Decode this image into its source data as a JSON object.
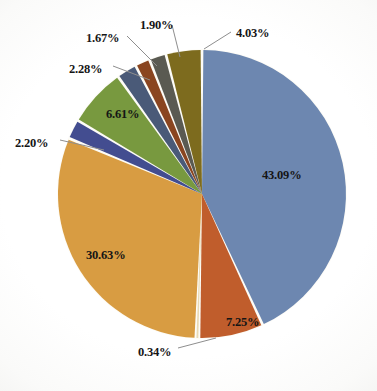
{
  "chart_data": {
    "type": "pie",
    "title": "",
    "subtitle": "",
    "xlabel": "",
    "ylabel": "",
    "legend_position": "none",
    "grid": false,
    "units": "percent",
    "start_angle_deg": 0,
    "direction": "clockwise",
    "center": {
      "x": 202,
      "y": 194
    },
    "radius": 144,
    "categories": [
      "Slice 1",
      "Slice 2",
      "Slice 3",
      "Slice 4",
      "Slice 5",
      "Slice 6",
      "Slice 7",
      "Slice 8",
      "Slice 9",
      "Slice 10"
    ],
    "values": [
      43.09,
      7.25,
      0.34,
      30.63,
      2.2,
      6.61,
      2.28,
      1.67,
      1.9,
      4.03
    ],
    "labels": [
      "43.09%",
      "7.25%",
      "0.34%",
      "30.63%",
      "2.20%",
      "6.61%",
      "2.28%",
      "1.67%",
      "1.90%",
      "4.03%"
    ],
    "colors": [
      "#6d87b0",
      "#c05d2c",
      "#e8d9b4",
      "#d89c42",
      "#434d90",
      "#78993f",
      "#4a5a78",
      "#8a4520",
      "#5a5a52",
      "#7d6b1e"
    ],
    "slice_gap_color": "#fdfcf7",
    "background": "#ffffff",
    "label_color": "#151515"
  },
  "labels": {
    "l1": {
      "text": "43.09%",
      "x": 262,
      "y": 169,
      "placement": "inside"
    },
    "l2": {
      "text": "7.25%",
      "x": 226,
      "y": 316,
      "placement": "inside"
    },
    "l3": {
      "text": "0.34%",
      "x": 138,
      "y": 346,
      "placement": "outside"
    },
    "l4": {
      "text": "30.63%",
      "x": 86,
      "y": 249,
      "placement": "inside"
    },
    "l5": {
      "text": "2.20%",
      "x": 15,
      "y": 137,
      "placement": "outside"
    },
    "l6": {
      "text": "6.61%",
      "x": 106,
      "y": 108,
      "placement": "inside"
    },
    "l7": {
      "text": "2.28%",
      "x": 69,
      "y": 63,
      "placement": "outside"
    },
    "l8": {
      "text": "1.67%",
      "x": 86,
      "y": 32,
      "placement": "outside"
    },
    "l9": {
      "text": "1.90%",
      "x": 140,
      "y": 19,
      "placement": "outside"
    },
    "l10": {
      "text": "4.03%",
      "x": 236,
      "y": 27,
      "placement": "outside"
    }
  }
}
